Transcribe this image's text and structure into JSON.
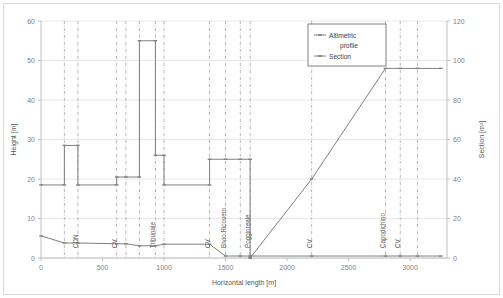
{
  "chart_data": {
    "type": "line",
    "title": "",
    "xlabel": "Horizontal length [m]",
    "ylabel": "Height [m]",
    "y2label": "Section [m²]",
    "xlim": [
      0,
      3300
    ],
    "ylim": [
      0,
      60
    ],
    "y2lim": [
      0,
      120
    ],
    "xticks": [
      0,
      500,
      1000,
      1500,
      2000,
      2500,
      3000
    ],
    "yticks": [
      0,
      10,
      20,
      30,
      40,
      50,
      60
    ],
    "y2ticks": [
      0,
      20,
      40,
      60,
      80,
      100,
      120
    ],
    "grid": "horizontal",
    "legend_position": "top-right",
    "series": [
      {
        "name": "Altimetric profile",
        "axis": "left",
        "marker": "dash",
        "color": "#808080",
        "points": [
          {
            "x": 0,
            "y": 5.6
          },
          {
            "x": 190,
            "y": 3.8
          },
          {
            "x": 300,
            "y": 3.8
          },
          {
            "x": 615,
            "y": 3.6
          },
          {
            "x": 690,
            "y": 3.6
          },
          {
            "x": 800,
            "y": 3.1
          },
          {
            "x": 930,
            "y": 3.1
          },
          {
            "x": 1000,
            "y": 3.5
          },
          {
            "x": 1370,
            "y": 3.5
          },
          {
            "x": 1500,
            "y": 0.5
          },
          {
            "x": 1620,
            "y": 0.5
          },
          {
            "x": 1700,
            "y": 0.5
          },
          {
            "x": 2200,
            "y": 0.5
          },
          {
            "x": 2800,
            "y": 0.5
          },
          {
            "x": 2920,
            "y": 0.5
          },
          {
            "x": 3060,
            "y": 0.5
          },
          {
            "x": 3250,
            "y": 0.5
          }
        ]
      },
      {
        "name": "Section",
        "axis": "right",
        "marker": "dash",
        "color": "#808080",
        "points": [
          {
            "x": 0,
            "y": 37
          },
          {
            "x": 190,
            "y": 37
          },
          {
            "x": 190,
            "y": 57
          },
          {
            "x": 300,
            "y": 57
          },
          {
            "x": 300,
            "y": 37
          },
          {
            "x": 615,
            "y": 37
          },
          {
            "x": 615,
            "y": 41
          },
          {
            "x": 690,
            "y": 41
          },
          {
            "x": 800,
            "y": 41
          },
          {
            "x": 800,
            "y": 110
          },
          {
            "x": 930,
            "y": 110
          },
          {
            "x": 930,
            "y": 52
          },
          {
            "x": 1000,
            "y": 52
          },
          {
            "x": 1000,
            "y": 37
          },
          {
            "x": 1370,
            "y": 37
          },
          {
            "x": 1370,
            "y": 50
          },
          {
            "x": 1500,
            "y": 50
          },
          {
            "x": 1620,
            "y": 50
          },
          {
            "x": 1700,
            "y": 50
          },
          {
            "x": 1700,
            "y": 0
          },
          {
            "x": 1700,
            "y": 0
          },
          {
            "x": 2200,
            "y": 40
          },
          {
            "x": 2800,
            "y": 96
          },
          {
            "x": 2920,
            "y": 96
          },
          {
            "x": 3060,
            "y": 96
          },
          {
            "x": 3250,
            "y": 96
          }
        ]
      }
    ],
    "station_markers": [
      {
        "label": "",
        "x": 190
      },
      {
        "label": "CDN",
        "x": 300
      },
      {
        "label": "CV",
        "x": 615
      },
      {
        "label": "",
        "x": 690
      },
      {
        "label": "",
        "x": 800
      },
      {
        "label": "Tribunale",
        "x": 930
      },
      {
        "label": "",
        "x": 1000
      },
      {
        "label": "CV",
        "x": 1370
      },
      {
        "label": "Bivio Ricovero",
        "x": 1500
      },
      {
        "label": "",
        "x": 1620
      },
      {
        "label": "Poggioreale",
        "x": 1700
      },
      {
        "label": "CV",
        "x": 2200
      },
      {
        "label": "Capodichino",
        "x": 2800
      },
      {
        "label": "CV",
        "x": 2920
      },
      {
        "label": "",
        "x": 3060
      }
    ]
  },
  "legend": {
    "items": [
      {
        "label_line1": "Altimetric",
        "label_line2": "profile"
      },
      {
        "label_line1": "Section",
        "label_line2": ""
      }
    ]
  },
  "axes": {
    "x_title": "Horizontal length [m]",
    "y_left_title": "Height [m]",
    "y_right_title": "Section [m²]",
    "x_ticks": [
      "0",
      "500",
      "1000",
      "1500",
      "2000",
      "2500",
      "3000"
    ],
    "y_left_ticks": [
      "0",
      "10",
      "20",
      "30",
      "40",
      "50",
      "60"
    ],
    "y_right_ticks": [
      "0",
      "20",
      "40",
      "60",
      "80",
      "100",
      "120"
    ]
  },
  "colors": {
    "line": "#808080",
    "grid": "#e8e8e8",
    "axis": "#bfbfbf",
    "station": "#a6a6a6",
    "text": "#7f7f7f",
    "background": "#ffffff",
    "border": "#d9d9d9"
  }
}
